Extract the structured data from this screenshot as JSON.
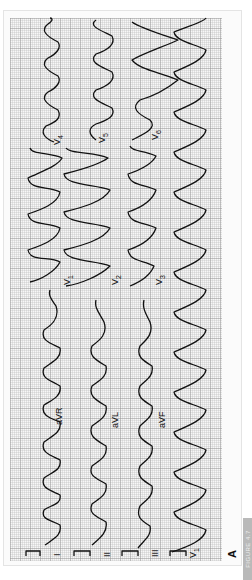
{
  "figure": {
    "panel_label": "A",
    "figure_tab": "FIGURE 4.7",
    "orientation": "rotated-90-ccw",
    "colors": {
      "trace": "#111111",
      "grid_major": "#969696",
      "grid_minor": "#bebebe",
      "paper": "#f7f7f7",
      "tab": "#b9b9b9"
    }
  },
  "ecg": {
    "columns": [
      {
        "segments": [
          {
            "lead": "I",
            "label": "I"
          },
          {
            "lead": "aVR",
            "label": "aVR"
          },
          {
            "lead": "V1",
            "label": "V",
            "sub": "1"
          },
          {
            "lead": "V4",
            "label": "V",
            "sub": "4"
          }
        ]
      },
      {
        "segments": [
          {
            "lead": "II",
            "label": "II"
          },
          {
            "lead": "aVL",
            "label": "aVL"
          },
          {
            "lead": "V2",
            "label": "V",
            "sub": "2"
          },
          {
            "lead": "V5",
            "label": "V",
            "sub": "5"
          }
        ]
      },
      {
        "segments": [
          {
            "lead": "III",
            "label": "III"
          },
          {
            "lead": "aVF",
            "label": "aVF"
          },
          {
            "lead": "V3",
            "label": "V",
            "sub": "3"
          },
          {
            "lead": "V6",
            "label": "V",
            "sub": "6"
          }
        ]
      },
      {
        "segments": [
          {
            "lead": "V1-rhythm",
            "label": "V",
            "sub": "1"
          }
        ]
      }
    ]
  },
  "labels": {
    "I": "I",
    "II": "II",
    "III": "III",
    "aVR": "aVR",
    "aVL": "aVL",
    "aVF": "aVF",
    "V": "V",
    "sub1": "1",
    "sub2": "2",
    "sub3": "3",
    "sub4": "4",
    "sub5": "5",
    "sub6": "6"
  }
}
